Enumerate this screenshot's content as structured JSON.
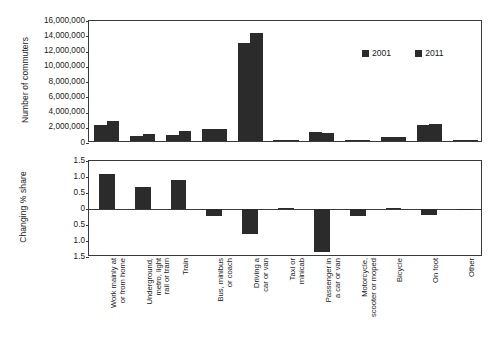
{
  "chart_data": [
    {
      "type": "bar",
      "panel": "top",
      "title": "",
      "xlabel": "",
      "ylabel": "Number of commuters",
      "ylim": [
        0,
        16000000
      ],
      "ytick_labels": [
        "16,000,000",
        "14,000,000",
        "12,000,000",
        "10,000,000",
        "8,000,000",
        "6,000,000",
        "4,000,000",
        "2,000,000",
        "0"
      ],
      "ytick_values": [
        16000000,
        14000000,
        12000000,
        10000000,
        8000000,
        6000000,
        4000000,
        2000000,
        0
      ],
      "grid": false,
      "legend_position": "upper-right",
      "categories": [
        "Work mainly at or from home",
        "Underground, metro, light rail or tram",
        "Train",
        "Bus, minibus or coach",
        "Driving a car or van",
        "Taxi or minicab",
        "Passenger in a car or van",
        "Motorcycle, scooter or moped",
        "Bicycle",
        "On foot",
        "Other"
      ],
      "series": [
        {
          "name": "2001",
          "values": [
            2100000,
            700000,
            850000,
            1550000,
            12800000,
            120000,
            1150000,
            100000,
            500000,
            2050000,
            90000
          ]
        },
        {
          "name": "2011",
          "values": [
            2650000,
            900000,
            1250000,
            1600000,
            14200000,
            140000,
            1020000,
            110000,
            580000,
            2250000,
            95000
          ]
        }
      ]
    },
    {
      "type": "bar",
      "panel": "bottom",
      "title": "",
      "xlabel": "",
      "ylabel": "Changing % share",
      "ylim": [
        -1.5,
        1.5
      ],
      "ytick_labels": [
        "1.5",
        "1.0",
        "0.5",
        "0",
        "0.5",
        "1.0",
        "1.5"
      ],
      "ytick_values": [
        1.5,
        1.0,
        0.5,
        0,
        -0.5,
        -1.0,
        -1.5
      ],
      "grid": false,
      "legend_position": "none",
      "categories": [
        "Work mainly at or from home",
        "Underground, metro, light rail or tram",
        "Train",
        "Bus, minibus or coach",
        "Driving a car or van",
        "Taxi or minicab",
        "Passenger in a car or van",
        "Motorcycle, scooter or moped",
        "Bicycle",
        "On foot",
        "Other"
      ],
      "series": [
        {
          "name": "Change in percentage share",
          "values": [
            1.1,
            0.68,
            0.9,
            -0.23,
            -0.78,
            0.02,
            -1.35,
            -0.22,
            0.03,
            -0.2,
            -0.02
          ]
        }
      ]
    }
  ],
  "top_chart": {
    "y_axis_title": "Number of commuters",
    "ytick_labels": [
      "16,000,000",
      "14,000,000",
      "12,000,000",
      "10,000,000",
      "8,000,000",
      "6,000,000",
      "4,000,000",
      "2,000,000",
      "0"
    ]
  },
  "bottom_chart": {
    "y_axis_title": "Changing % share",
    "ytick_labels": [
      "1.5",
      "1.0",
      "0.5",
      "0",
      "0.5",
      "1.0",
      "1.5"
    ]
  },
  "legend": {
    "entries": [
      {
        "label": "2001",
        "color": "#2b2b2b"
      },
      {
        "label": "2011",
        "color": "#2b2b2b"
      }
    ]
  },
  "categories": [
    "Work mainly at\nor from home",
    "Underground,\nmetro, light\nrail or tram",
    "Train",
    "Bus, minibus\nor coach",
    "Driving a\ncar or van",
    "Taxi or\nminicab",
    "Passenger in\na car or van",
    "Motorcycle,\nscooter or moped",
    "Bicycle",
    "On foot",
    "Other"
  ],
  "colors": {
    "bar": "#2b2b2b",
    "axis": "#3a3a3a",
    "text": "#1a1a1a",
    "background": "#ffffff"
  }
}
